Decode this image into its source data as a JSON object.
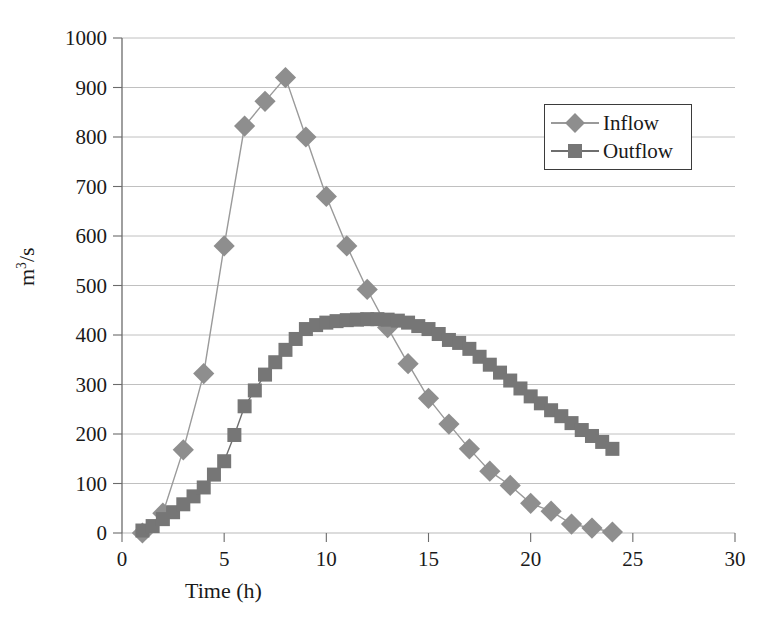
{
  "chart_data": {
    "type": "line",
    "title": "",
    "xlabel": "Time (h)",
    "ylabel": "m3/s",
    "ylabel_base": "m",
    "ylabel_sup": "3",
    "ylabel_tail": "/s",
    "xlim": [
      0,
      30
    ],
    "ylim": [
      0,
      1000
    ],
    "xticks": [
      0,
      5,
      10,
      15,
      20,
      25,
      30
    ],
    "yticks": [
      0,
      100,
      200,
      300,
      400,
      500,
      600,
      700,
      800,
      900,
      1000
    ],
    "grid": "horizontal",
    "legend_position": "upper-right-inside",
    "series": [
      {
        "name": "Inflow",
        "marker": "diamond",
        "color": "#8e8e8e",
        "line_color": "#9a9a9a",
        "x": [
          1,
          2,
          3,
          4,
          5,
          6,
          7,
          8,
          9,
          10,
          11,
          12,
          13,
          14,
          15,
          16,
          17,
          18,
          19,
          20,
          21,
          22,
          23,
          24
        ],
        "y": [
          0,
          40,
          168,
          322,
          580,
          822,
          872,
          920,
          800,
          680,
          580,
          492,
          415,
          342,
          272,
          220,
          170,
          125,
          96,
          60,
          44,
          18,
          10,
          2
        ]
      },
      {
        "name": "Outflow",
        "marker": "square",
        "color": "#767676",
        "line_color": "#6e6e6e",
        "x": [
          1,
          1.5,
          2,
          2.5,
          3,
          3.5,
          4,
          4.5,
          5,
          5.5,
          6,
          6.5,
          7,
          7.5,
          8,
          8.5,
          9,
          9.5,
          10,
          10.5,
          11,
          11.5,
          12,
          12.5,
          13,
          13.5,
          14,
          14.5,
          15,
          15.5,
          16,
          16.5,
          17,
          17.5,
          18,
          18.5,
          19,
          19.5,
          20,
          20.5,
          21,
          21.5,
          22,
          22.5,
          23,
          23.5,
          24
        ],
        "y": [
          5,
          14,
          28,
          42,
          58,
          74,
          92,
          118,
          145,
          198,
          256,
          288,
          320,
          345,
          370,
          392,
          412,
          420,
          425,
          428,
          430,
          431,
          432,
          432,
          431,
          429,
          425,
          418,
          412,
          402,
          390,
          384,
          372,
          356,
          340,
          324,
          308,
          292,
          276,
          262,
          248,
          236,
          222,
          208,
          196,
          184,
          170
        ]
      }
    ]
  },
  "legend": {
    "items": [
      {
        "label": "Inflow"
      },
      {
        "label": "Outflow"
      }
    ]
  },
  "axes": {
    "x_title": "Time (h)",
    "y_title_parts": {
      "base": "m",
      "exponent": "3",
      "tail": "/s"
    }
  }
}
